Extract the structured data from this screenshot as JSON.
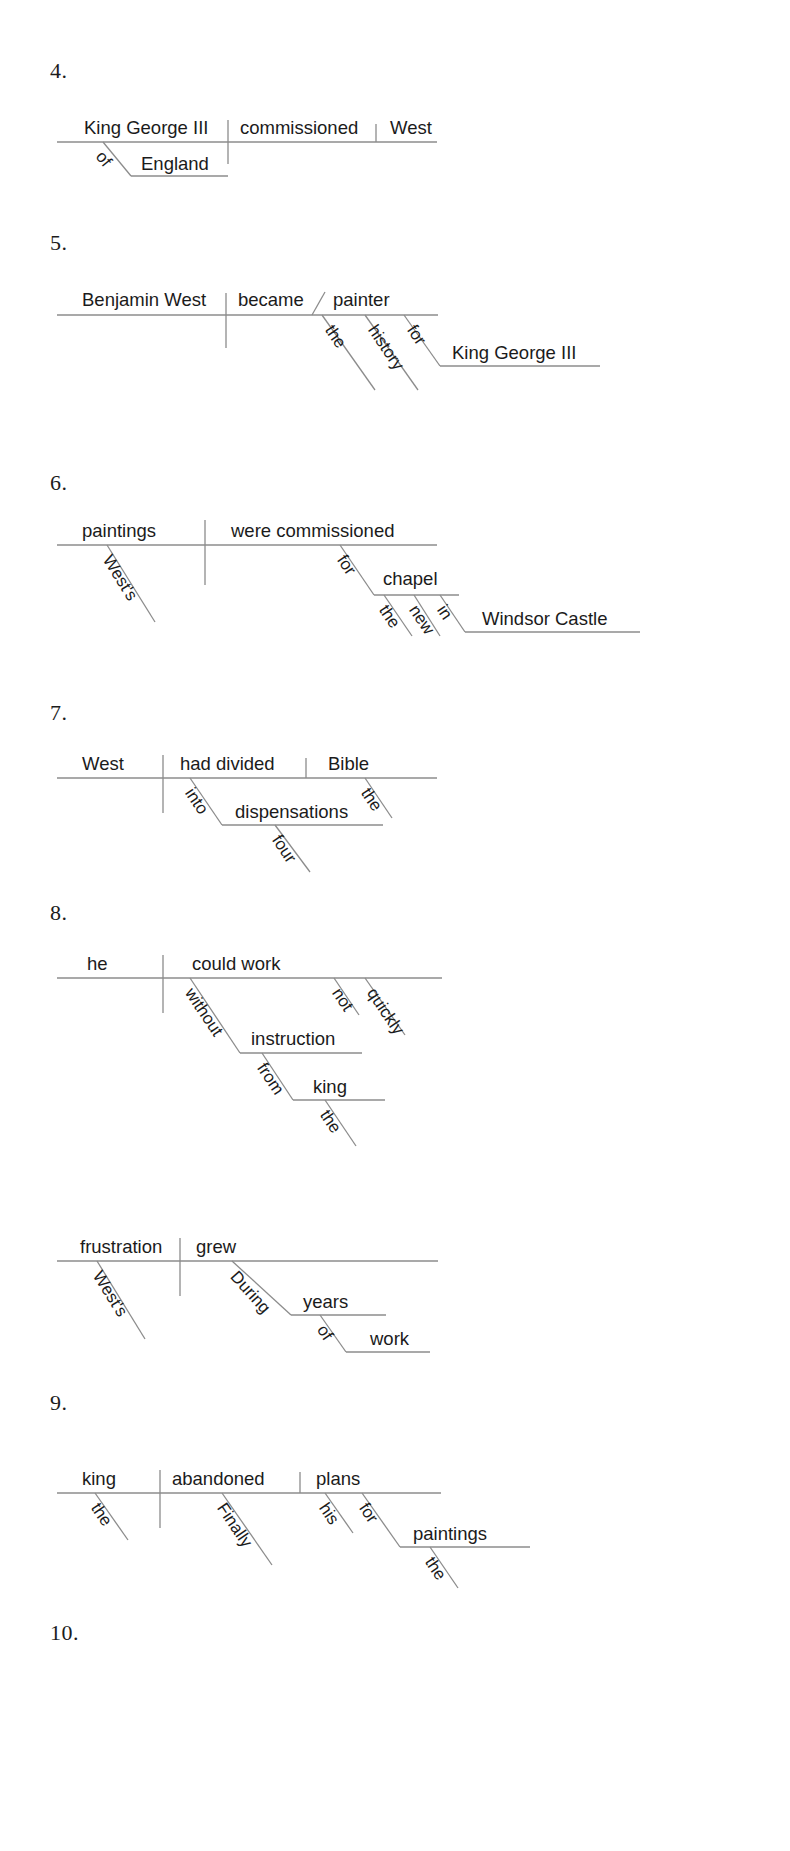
{
  "page": {
    "background_color": "#ffffff",
    "line_color": "#8c8c8c",
    "text_color": "#1b1b1b",
    "width": 790,
    "height": 1851,
    "kind": "sentence-diagram-worksheet"
  },
  "exercises": [
    {
      "number": "4.",
      "sentence": "King George III of England commissioned West.",
      "baseline": [
        {
          "role": "subject",
          "text": "King George III"
        },
        {
          "role": "verb",
          "text": "commissioned"
        },
        {
          "role": "direct-object",
          "text": "West"
        }
      ],
      "modifiers": [
        {
          "role": "preposition",
          "text": "of",
          "attaches_to": "King George III"
        },
        {
          "role": "object-of-preposition",
          "text": "England",
          "attaches_to": "of"
        }
      ]
    },
    {
      "number": "5.",
      "sentence": "Benjamin West became the history painter for King George III.",
      "baseline": [
        {
          "role": "subject",
          "text": "Benjamin West"
        },
        {
          "role": "linking-verb",
          "text": "became"
        },
        {
          "role": "predicate-nominative",
          "text": "painter"
        }
      ],
      "modifiers": [
        {
          "role": "article",
          "text": "the",
          "attaches_to": "painter"
        },
        {
          "role": "adjective",
          "text": "history",
          "attaches_to": "painter"
        },
        {
          "role": "preposition",
          "text": "for",
          "attaches_to": "painter"
        },
        {
          "role": "object-of-preposition",
          "text": "King George III",
          "attaches_to": "for"
        }
      ]
    },
    {
      "number": "6.",
      "sentence": "West's paintings were commissioned for the new chapel in Windsor Castle.",
      "baseline": [
        {
          "role": "subject",
          "text": "paintings"
        },
        {
          "role": "verb",
          "text": "were commissioned"
        }
      ],
      "modifiers": [
        {
          "role": "possessive",
          "text": "West's",
          "attaches_to": "paintings"
        },
        {
          "role": "preposition",
          "text": "for",
          "attaches_to": "were commissioned"
        },
        {
          "role": "object-of-preposition",
          "text": "chapel",
          "attaches_to": "for"
        },
        {
          "role": "article",
          "text": "the",
          "attaches_to": "chapel"
        },
        {
          "role": "adjective",
          "text": "new",
          "attaches_to": "chapel"
        },
        {
          "role": "preposition",
          "text": "in",
          "attaches_to": "chapel"
        },
        {
          "role": "object-of-preposition",
          "text": "Windsor Castle",
          "attaches_to": "in"
        }
      ]
    },
    {
      "number": "7.",
      "sentence": "West had divided the Bible into four dispensations.",
      "baseline": [
        {
          "role": "subject",
          "text": "West"
        },
        {
          "role": "verb",
          "text": "had divided"
        },
        {
          "role": "direct-object",
          "text": "Bible"
        }
      ],
      "modifiers": [
        {
          "role": "article",
          "text": "the",
          "attaches_to": "Bible"
        },
        {
          "role": "preposition",
          "text": "into",
          "attaches_to": "had divided"
        },
        {
          "role": "object-of-preposition",
          "text": "dispensations",
          "attaches_to": "into"
        },
        {
          "role": "adjective",
          "text": "four",
          "attaches_to": "dispensations"
        }
      ]
    },
    {
      "number": "8.",
      "sentence": "He could not work quickly without instruction from the king.",
      "baseline": [
        {
          "role": "subject",
          "text": "he"
        },
        {
          "role": "verb",
          "text": "could work"
        }
      ],
      "modifiers": [
        {
          "role": "adverb",
          "text": "not",
          "attaches_to": "could work"
        },
        {
          "role": "adverb",
          "text": "quickly",
          "attaches_to": "could work"
        },
        {
          "role": "preposition",
          "text": "without",
          "attaches_to": "could work"
        },
        {
          "role": "object-of-preposition",
          "text": "instruction",
          "attaches_to": "without"
        },
        {
          "role": "preposition",
          "text": "from",
          "attaches_to": "instruction"
        },
        {
          "role": "object-of-preposition",
          "text": "king",
          "attaches_to": "from"
        },
        {
          "role": "article",
          "text": "the",
          "attaches_to": "king"
        }
      ]
    },
    {
      "number": "9.",
      "sentence": "West's frustration grew during years of work.",
      "baseline": [
        {
          "role": "subject",
          "text": "frustration"
        },
        {
          "role": "verb",
          "text": "grew"
        }
      ],
      "modifiers": [
        {
          "role": "possessive",
          "text": "West's",
          "attaches_to": "frustration"
        },
        {
          "role": "preposition",
          "text": "During",
          "attaches_to": "grew"
        },
        {
          "role": "object-of-preposition",
          "text": "years",
          "attaches_to": "During"
        },
        {
          "role": "preposition",
          "text": "of",
          "attaches_to": "years"
        },
        {
          "role": "object-of-preposition",
          "text": "work",
          "attaches_to": "of"
        }
      ]
    },
    {
      "number": "10.",
      "sentence": "Finally the king abandoned his plans for the paintings.",
      "baseline": [
        {
          "role": "subject",
          "text": "king"
        },
        {
          "role": "verb",
          "text": "abandoned"
        },
        {
          "role": "direct-object",
          "text": "plans"
        }
      ],
      "modifiers": [
        {
          "role": "article",
          "text": "the",
          "attaches_to": "king"
        },
        {
          "role": "adverb",
          "text": "Finally",
          "attaches_to": "abandoned"
        },
        {
          "role": "possessive",
          "text": "his",
          "attaches_to": "plans"
        },
        {
          "role": "preposition",
          "text": "for",
          "attaches_to": "plans"
        },
        {
          "role": "object-of-preposition",
          "text": "paintings",
          "attaches_to": "for"
        },
        {
          "role": "article",
          "text": "the",
          "attaches_to": "paintings"
        }
      ]
    }
  ]
}
